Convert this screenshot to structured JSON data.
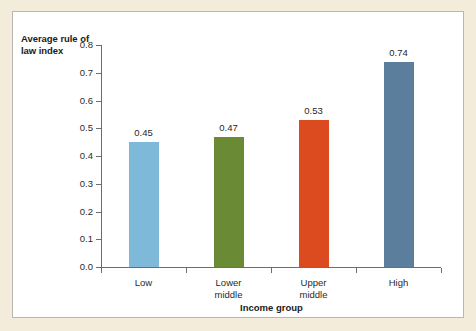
{
  "chart_data": {
    "type": "bar",
    "title": "",
    "subtitle": "",
    "xlabel": "Income group",
    "ylabel": "Average rule of law index",
    "categories": [
      "Low",
      "Lower middle",
      "Upper middle",
      "High"
    ],
    "values": [
      0.45,
      0.47,
      0.53,
      0.74
    ],
    "value_labels": [
      "0.45",
      "0.47",
      "0.53",
      "0.74"
    ],
    "bar_colors": [
      "#7fb9d9",
      "#6b8a35",
      "#dc4a20",
      "#5a7e9b"
    ],
    "ylim": [
      0.0,
      0.8
    ],
    "ytick_labels": [
      "0.0",
      "0.1",
      "0.2",
      "0.3",
      "0.4",
      "0.5",
      "0.6",
      "0.7",
      "0.8"
    ],
    "ytick_values": [
      0.0,
      0.1,
      0.2,
      0.3,
      0.4,
      0.5,
      0.6,
      0.7,
      0.8
    ],
    "grid": false,
    "legend": false,
    "legend_position": "none",
    "axis_color": "#6d6d6d",
    "plot_background": "#ffffff",
    "figure_background": "#f3ecda"
  }
}
